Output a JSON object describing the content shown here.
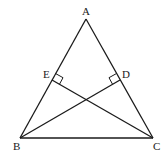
{
  "diagram": {
    "type": "geometry",
    "labels": {
      "A": "A",
      "B": "B",
      "C": "C",
      "D": "D",
      "E": "E"
    },
    "points": {
      "A": [
        86,
        19
      ],
      "B": [
        20,
        138
      ],
      "C": [
        153,
        138
      ],
      "D": [
        120,
        80
      ],
      "E": [
        52,
        80
      ]
    },
    "segments": [
      [
        "A",
        "B"
      ],
      [
        "A",
        "C"
      ],
      [
        "B",
        "C"
      ],
      [
        "B",
        "D"
      ],
      [
        "C",
        "E"
      ]
    ],
    "right_angles": [
      "E",
      "D"
    ],
    "stroke_color": "#1a1a1a"
  }
}
